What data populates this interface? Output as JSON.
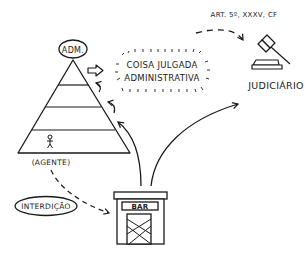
{
  "diagram": {
    "nodes": {
      "adm": {
        "label": "ADM."
      },
      "coisa_julgada": {
        "line1": "COISA JULGADA",
        "line2": "ADMINISTRATIVA"
      },
      "judiciario": {
        "label": "JUDICIÁRIO"
      },
      "agente": {
        "label": "(AGENTE)"
      },
      "interdicao": {
        "label": "INTERDIÇÃO"
      },
      "bar": {
        "label": "BAR"
      }
    },
    "edges": {
      "adm_to_coisa": {
        "style": "block-arrow"
      },
      "coisa_to_judiciario": {
        "label": "ART. 5º, XXXV, CF",
        "style": "dashed"
      },
      "agente_to_bar": {
        "style": "dashed"
      },
      "bar_to_pyramid": {
        "style": "solid"
      },
      "bar_to_judiciario": {
        "style": "solid"
      }
    },
    "icons": [
      "pyramid-icon",
      "gavel-icon",
      "stick-figure-icon",
      "closed-bar-icon"
    ]
  }
}
